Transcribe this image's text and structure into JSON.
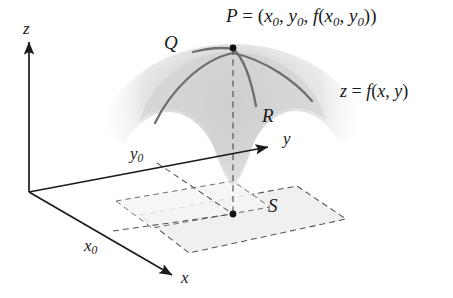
{
  "figure": {
    "title_alt": "Partial derivatives of a surface z = f(x, y) at point P",
    "background_color": "#ffffff",
    "ink_color": "#1a1a1a",
    "surface_fill_color": "#d6d6d6",
    "curve_color": "#6e6e6e",
    "dashed_color": "#555555",
    "region_fill_color": "#efefef"
  },
  "axes": {
    "z_label": "z",
    "y_label": "y",
    "x_label": "x",
    "origin_label": ""
  },
  "ticks": {
    "x0_label": "x",
    "x0_sub": "0",
    "y0_label": "y",
    "y0_sub": "0"
  },
  "points": {
    "P_name": "P",
    "P_equals": "=",
    "P_coords_open": "(",
    "P_coord_x": "x",
    "P_coord_x_sub": "0",
    "P_sep1": ", ",
    "P_coord_y": "y",
    "P_coord_y_sub": "0",
    "P_sep2": ", ",
    "P_fn": "f",
    "P_fn_open": "(",
    "P_fn_x": "x",
    "P_fn_x_sub": "0",
    "P_fn_sep": ", ",
    "P_fn_y": "y",
    "P_fn_y_sub": "0",
    "P_fn_close": ")",
    "P_coords_close": ")",
    "Q_label": "Q",
    "R_label": "R",
    "S_label": "S"
  },
  "surface": {
    "equation_z": "z",
    "equation_eq": "=",
    "equation_f": "f",
    "equation_open": "(",
    "equation_x": "x",
    "equation_comma": ", ",
    "equation_y": "y",
    "equation_close": ")"
  }
}
